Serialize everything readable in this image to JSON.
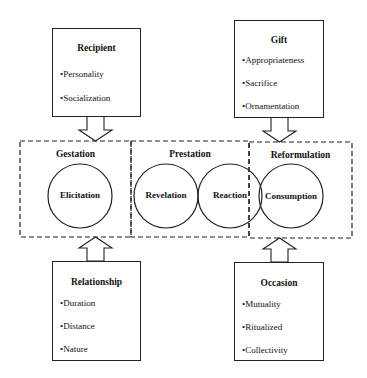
{
  "diagram": {
    "type": "gift-exchange-process-model",
    "input_boxes": {
      "recipient": {
        "title": "Recipient",
        "items": [
          "•Personality",
          "•Socialization"
        ]
      },
      "gift": {
        "title": "Gift",
        "items": [
          "•Appropriateness",
          "•Sacrifice",
          "•Ornamentation"
        ]
      },
      "relationship": {
        "title": "Relationship",
        "items": [
          "•Duration",
          "•Distance",
          "•Nature"
        ]
      },
      "occasion": {
        "title": "Occasion",
        "items": [
          "•Mutuality",
          "•Ritualized",
          "•Collectivity"
        ]
      }
    },
    "stages": [
      {
        "label": "Gestation",
        "phases": [
          "Elicitation"
        ]
      },
      {
        "label": "Prestation",
        "phases": [
          "Revelation",
          "Reaction"
        ]
      },
      {
        "label": "Reformulation",
        "phases": [
          "Consumption"
        ]
      }
    ],
    "phases": {
      "elicitation": "Elicitation",
      "revelation": "Revelation",
      "reaction": "Reaction",
      "consumption": "Consumption"
    },
    "arrows": [
      {
        "from": "Recipient",
        "to": "Gestation",
        "direction": "down"
      },
      {
        "from": "Gift",
        "to": "Reformulation",
        "direction": "down"
      },
      {
        "from": "Relationship",
        "to": "Gestation",
        "direction": "up"
      },
      {
        "from": "Occasion",
        "to": "Reformulation",
        "direction": "up"
      }
    ],
    "colors": {
      "stroke": "#222222",
      "background": "#ffffff",
      "text": "#111111"
    }
  }
}
